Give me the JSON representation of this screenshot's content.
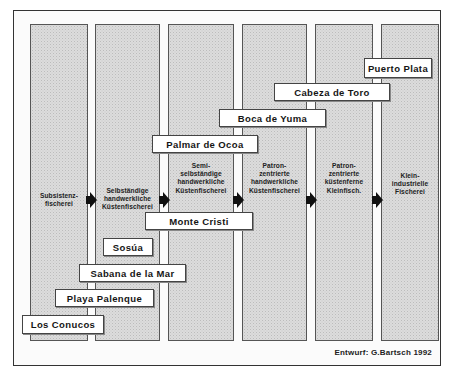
{
  "diagram": {
    "type": "stage-progression",
    "stages": [
      {
        "label": "Subsistenz-\nfischerei"
      },
      {
        "label": "Selbständige\nhandwerkliche\nKüstenfischerei"
      },
      {
        "label": "Semi-\nselbständige\nhandwerkliche\nKüstenfischerei"
      },
      {
        "label": "Patron-\nzentrierte\nhandwerkliche\nKüstenfischerei"
      },
      {
        "label": "Patron-\nzentrierte\nküstenferne\nKleinfisch."
      },
      {
        "label": "Klein-\nindustrielle\nFischerei"
      }
    ],
    "places": [
      {
        "name": "Puerto Plata"
      },
      {
        "name": "Cabeza de Toro"
      },
      {
        "name": "Boca de Yuma"
      },
      {
        "name": "Palmar de Ocoa"
      },
      {
        "name": "Monte Cristi"
      },
      {
        "name": "Sosúa"
      },
      {
        "name": "Sabana de la Mar"
      },
      {
        "name": "Playa Palenque"
      },
      {
        "name": "Los Conucos"
      }
    ],
    "credit": "Entwurf: G.Bartsch 1992"
  },
  "colors": {
    "column_fill": "#dcdcdc",
    "box_fill": "#ffffff",
    "arrow": "#111111",
    "border": "#333333"
  }
}
